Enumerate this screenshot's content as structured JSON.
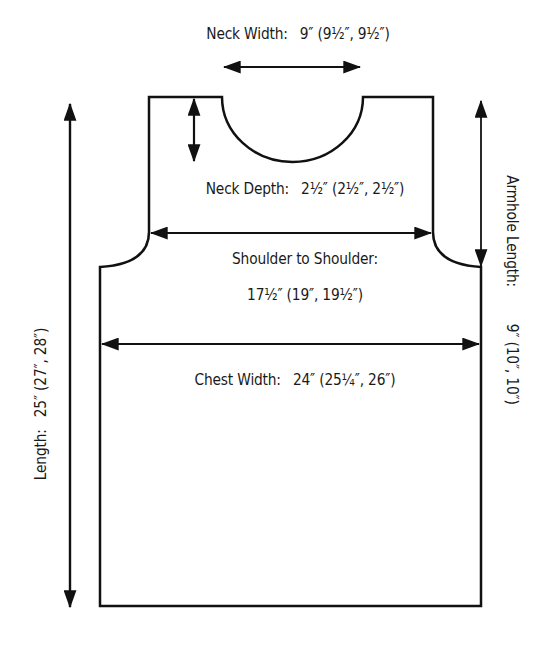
{
  "diagram": {
    "type": "knitting-schematic",
    "stroke_color": "#111111",
    "background": "#ffffff"
  },
  "measurements": {
    "neck_width": {
      "label": "Neck Width:",
      "value": "9″ (9½″, 9½″)"
    },
    "neck_depth": {
      "label": "Neck Depth:",
      "value": "2½″ (2½″, 2½″)"
    },
    "shoulder_to_shoulder": {
      "label": "Shoulder to Shoulder:",
      "value": "17½″ (19″, 19½″)"
    },
    "chest_width": {
      "label": "Chest Width:",
      "value": "24″ (25¼″, 26″)"
    },
    "length": {
      "label": "Length:",
      "value": "25″ (27″, 28″)"
    },
    "armhole_length": {
      "label": "Armhole Length:",
      "value": "9″ (10″, 10″)"
    }
  }
}
